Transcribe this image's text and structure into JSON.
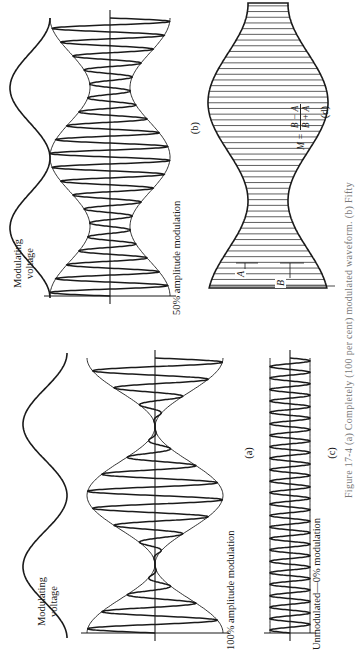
{
  "figure": {
    "orientation": "rotated -90deg (text reads bottom-to-top)",
    "caption": "Figure 17-4  (a) Completely (100 per cent) modulated waveform. (b) Fifty",
    "panels": {
      "a": {
        "tag": "(a)",
        "title": "100% amplitude modulation",
        "modulating_label_line1": "Modulating",
        "modulating_label_line2": "voltage",
        "modulation_index": 1.0
      },
      "b": {
        "tag": "(b)",
        "title": "50% amplitude modulation",
        "modulating_label_line1": "Modulating",
        "modulating_label_line2": "voltage",
        "modulation_index": 0.5
      },
      "c": {
        "tag": "(c)",
        "title": "Unmodulated—0% modulation",
        "modulation_index": 0.0
      },
      "d": {
        "tag": "(d)",
        "dim_a": "A",
        "dim_b": "B",
        "formula_lhs": "M =",
        "formula_num": "B − A",
        "formula_den": "B + A"
      }
    }
  },
  "colors": {
    "ink": "#1a1a1a",
    "paper": "#ffffff",
    "caption": "#777777"
  }
}
